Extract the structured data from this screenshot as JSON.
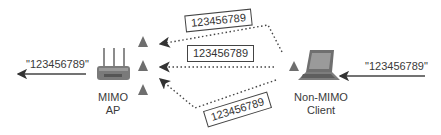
{
  "diagram": {
    "ap": {
      "label_line1": "MIMO",
      "label_line2": "AP",
      "output_string": "\"123456789\""
    },
    "client": {
      "label_line1": "Non-MIMO",
      "label_line2": "Client",
      "input_string": "\"123456789\""
    },
    "signal_paths": [
      {
        "name": "top-path",
        "payload": "123456789"
      },
      {
        "name": "middle-path",
        "payload": "123456789"
      },
      {
        "name": "bottom-path",
        "payload": "123456789"
      }
    ],
    "colors": {
      "triangle": "#6e6e6e",
      "line": "#555555",
      "device": "#777777"
    }
  }
}
